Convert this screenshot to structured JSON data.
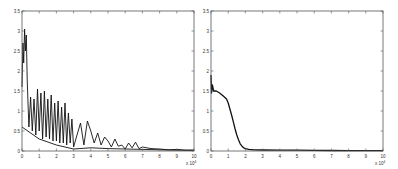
{
  "chart_data": [
    {
      "type": "line",
      "title": "",
      "xlabel": "",
      "ylabel": "",
      "x_multiplier": "x 10^4",
      "xlim": [
        0,
        10
      ],
      "ylim": [
        0,
        3.5
      ],
      "xticks": [
        "0",
        "1",
        "2",
        "3",
        "4",
        "5",
        "6",
        "7",
        "8",
        "9",
        "10"
      ],
      "yticks": [
        "0",
        "0.5",
        "1",
        "1.5",
        "2",
        "2.5",
        "3",
        "3.5"
      ],
      "grid": false,
      "legend": null,
      "frame": {
        "left": 22,
        "top": 11,
        "right": 194,
        "bottom": 151
      },
      "series": [
        {
          "name": "signal-envelope-upper",
          "color": "#111111",
          "description": "dense oscillating trace, peak ~3.05 near x=0.2, decaying with ripples to ~0 by x=10",
          "x": [
            0,
            0.05,
            0.1,
            0.15,
            0.2,
            0.25,
            0.3,
            0.35,
            0.4,
            0.5,
            0.6,
            0.7,
            0.8,
            0.9,
            1.0,
            1.1,
            1.2,
            1.3,
            1.4,
            1.5,
            1.6,
            1.7,
            1.8,
            1.9,
            2.0,
            2.1,
            2.2,
            2.3,
            2.4,
            2.5,
            2.6,
            2.7,
            2.8,
            2.9,
            3.0,
            3.2,
            3.4,
            3.6,
            3.8,
            4.0,
            4.2,
            4.4,
            4.6,
            4.8,
            5.0,
            5.2,
            5.4,
            5.6,
            5.8,
            6.0,
            6.2,
            6.4,
            6.6,
            6.8,
            7.0,
            7.5,
            8.0,
            8.5,
            9.0,
            9.5,
            10.0
          ],
          "y": [
            1.6,
            2.7,
            2.2,
            3.05,
            2.5,
            2.9,
            1.8,
            1.2,
            0.6,
            1.35,
            0.5,
            1.3,
            0.4,
            1.55,
            0.5,
            1.45,
            0.3,
            1.5,
            0.35,
            1.3,
            0.3,
            1.4,
            0.25,
            1.2,
            0.25,
            1.25,
            0.2,
            1.1,
            0.2,
            1.2,
            0.15,
            0.95,
            0.2,
            0.8,
            0.1,
            0.4,
            0.7,
            0.15,
            0.75,
            0.5,
            0.2,
            0.45,
            0.15,
            0.35,
            0.25,
            0.1,
            0.3,
            0.12,
            0.15,
            0.05,
            0.2,
            0.08,
            0.22,
            0.06,
            0.1,
            0.06,
            0.05,
            0.03,
            0.04,
            0.02,
            0.02
          ]
        },
        {
          "name": "signal-baseline",
          "color": "#111111",
          "description": "lower trace near zero from x≈3 onward",
          "x": [
            0,
            1,
            2,
            3,
            4,
            5,
            6,
            7,
            8,
            9,
            10
          ],
          "y": [
            0.6,
            0.3,
            0.15,
            0.05,
            0.08,
            0.06,
            0.05,
            0.04,
            0.03,
            0.02,
            0.02
          ]
        }
      ]
    },
    {
      "type": "line",
      "title": "",
      "xlabel": "",
      "ylabel": "",
      "x_multiplier": "x 10^4",
      "xlim": [
        0,
        10
      ],
      "ylim": [
        0,
        3.5
      ],
      "xticks": [
        "0",
        "1",
        "2",
        "3",
        "4",
        "5",
        "6",
        "7",
        "8",
        "9",
        "10"
      ],
      "yticks": [
        "0",
        "0.5",
        "1",
        "1.5",
        "2",
        "2.5",
        "3",
        "3.5"
      ],
      "grid": false,
      "legend": null,
      "frame": {
        "left": 211,
        "top": 11,
        "right": 383,
        "bottom": 151
      },
      "series": [
        {
          "name": "smoothed-signal",
          "color": "#111111",
          "description": "spike to ~1.9 at x=0, plateau ~1.5 to x≈0.7, sigmoid drop to ~0.05 by x≈2.2, near zero afterwards",
          "x": [
            0,
            0.03,
            0.08,
            0.15,
            0.3,
            0.5,
            0.7,
            0.9,
            1.0,
            1.1,
            1.2,
            1.3,
            1.4,
            1.5,
            1.6,
            1.7,
            1.8,
            1.9,
            2.0,
            2.2,
            2.5,
            3.0,
            4.0,
            5.0,
            6.0,
            7.0,
            8.0,
            9.0,
            10.0
          ],
          "y": [
            1.9,
            1.45,
            1.65,
            1.5,
            1.5,
            1.45,
            1.38,
            1.3,
            1.2,
            1.05,
            0.9,
            0.72,
            0.55,
            0.4,
            0.28,
            0.18,
            0.12,
            0.08,
            0.06,
            0.04,
            0.03,
            0.025,
            0.02,
            0.02,
            0.015,
            0.012,
            0.01,
            0.01,
            0.01
          ]
        }
      ]
    }
  ]
}
